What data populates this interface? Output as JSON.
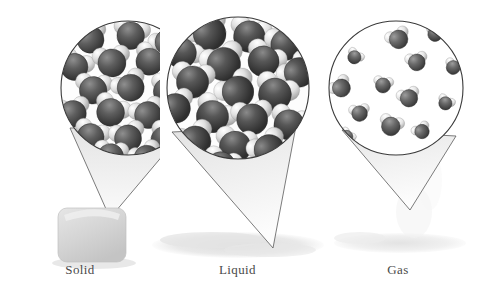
{
  "figure": {
    "background_color": "#ffffff",
    "width": 478,
    "height": 295
  },
  "palette": {
    "oxygen_dark": "#4b4b4b",
    "oxygen_mid": "#6e6e6e",
    "oxygen_light": "#9a9a9a",
    "hydrogen_light": "#f2f2f2",
    "hydrogen_mid": "#cfcfcf",
    "outline": "#3a3a3a",
    "cone_fill": "#ededed",
    "sample_fill": "#d8d8d8",
    "shadow": "#e2e2e2",
    "label_color": "#4a4a4a"
  },
  "panels": [
    {
      "key": "solid",
      "label": "Solid",
      "magnifier": {
        "cx": 128,
        "cy": 88,
        "r": 67
      },
      "cone": {
        "tip_x": 110,
        "tip_y": 218
      },
      "sample": {
        "type": "ice-cube",
        "x": 58,
        "y": 208,
        "width": 68,
        "height": 54
      },
      "packing": "ordered-lattice",
      "molecule_count": 20,
      "description": "Molecules locked in a fixed, ordered crystalline lattice"
    },
    {
      "key": "liquid",
      "label": "Liquid",
      "magnifier": {
        "cx": 238,
        "cy": 88,
        "r": 71
      },
      "cone": {
        "tip_x": 273,
        "tip_y": 248
      },
      "sample": {
        "type": "puddle",
        "x": 152,
        "y": 232,
        "width": 172,
        "height": 26
      },
      "packing": "close-packed-disordered",
      "molecule_count": 18,
      "description": "Molecules close together but free to slide past one another"
    },
    {
      "key": "gas",
      "label": "Gas",
      "magnifier": {
        "cx": 396,
        "cy": 88,
        "r": 67
      },
      "cone": {
        "tip_x": 410,
        "tip_y": 210
      },
      "sample": {
        "type": "vapor",
        "x": 330,
        "y": 230,
        "width": 140,
        "height": 24
      },
      "packing": "sparse-random",
      "molecule_count": 13,
      "description": "Molecules widely separated and moving independently"
    }
  ],
  "molecules": {
    "solid": [
      {
        "x": 0.22,
        "y": 0.12,
        "s": 1.0,
        "rot": -18
      },
      {
        "x": 0.52,
        "y": 0.09,
        "s": 1.02,
        "rot": 12
      },
      {
        "x": 0.8,
        "y": 0.14,
        "s": 0.98,
        "rot": -34
      },
      {
        "x": 0.1,
        "y": 0.33,
        "s": 1.0,
        "rot": 24
      },
      {
        "x": 0.38,
        "y": 0.3,
        "s": 1.04,
        "rot": -8
      },
      {
        "x": 0.66,
        "y": 0.29,
        "s": 1.0,
        "rot": 30
      },
      {
        "x": 0.92,
        "y": 0.35,
        "s": 0.96,
        "rot": -22
      },
      {
        "x": 0.24,
        "y": 0.51,
        "s": 1.02,
        "rot": 6
      },
      {
        "x": 0.52,
        "y": 0.49,
        "s": 1.0,
        "rot": -28
      },
      {
        "x": 0.79,
        "y": 0.52,
        "s": 1.0,
        "rot": 18
      },
      {
        "x": 0.09,
        "y": 0.69,
        "s": 0.98,
        "rot": -12
      },
      {
        "x": 0.37,
        "y": 0.68,
        "s": 1.03,
        "rot": 26
      },
      {
        "x": 0.65,
        "y": 0.7,
        "s": 1.0,
        "rot": -20
      },
      {
        "x": 0.91,
        "y": 0.72,
        "s": 0.96,
        "rot": 10
      },
      {
        "x": 0.22,
        "y": 0.87,
        "s": 1.0,
        "rot": 20
      },
      {
        "x": 0.5,
        "y": 0.88,
        "s": 1.0,
        "rot": -14
      },
      {
        "x": 0.77,
        "y": 0.89,
        "s": 0.98,
        "rot": 32
      },
      {
        "x": 0.37,
        "y": 1.02,
        "s": 0.96,
        "rot": 8
      },
      {
        "x": 0.64,
        "y": 1.03,
        "s": 0.94,
        "rot": -26
      },
      {
        "x": 0.09,
        "y": 1.0,
        "s": 0.94,
        "rot": 16
      }
    ],
    "liquid": [
      {
        "x": 0.3,
        "y": 0.1,
        "s": 1.06,
        "rot": -30
      },
      {
        "x": 0.58,
        "y": 0.12,
        "s": 1.02,
        "rot": 16
      },
      {
        "x": 0.84,
        "y": 0.18,
        "s": 1.0,
        "rot": -10
      },
      {
        "x": 0.1,
        "y": 0.24,
        "s": 0.98,
        "rot": 40
      },
      {
        "x": 0.4,
        "y": 0.32,
        "s": 1.08,
        "rot": -20
      },
      {
        "x": 0.68,
        "y": 0.3,
        "s": 1.0,
        "rot": 28
      },
      {
        "x": 0.93,
        "y": 0.38,
        "s": 0.96,
        "rot": -40
      },
      {
        "x": 0.18,
        "y": 0.45,
        "s": 1.04,
        "rot": 8
      },
      {
        "x": 0.5,
        "y": 0.52,
        "s": 1.02,
        "rot": -34
      },
      {
        "x": 0.76,
        "y": 0.54,
        "s": 1.06,
        "rot": 22
      },
      {
        "x": 0.06,
        "y": 0.64,
        "s": 0.96,
        "rot": -16
      },
      {
        "x": 0.32,
        "y": 0.7,
        "s": 1.04,
        "rot": 34
      },
      {
        "x": 0.6,
        "y": 0.72,
        "s": 1.0,
        "rot": -6
      },
      {
        "x": 0.86,
        "y": 0.76,
        "s": 0.98,
        "rot": 18
      },
      {
        "x": 0.2,
        "y": 0.88,
        "s": 1.0,
        "rot": -24
      },
      {
        "x": 0.48,
        "y": 0.92,
        "s": 1.02,
        "rot": 12
      },
      {
        "x": 0.72,
        "y": 0.94,
        "s": 0.98,
        "rot": -32
      },
      {
        "x": 0.38,
        "y": 1.06,
        "s": 0.94,
        "rot": 20
      }
    ],
    "gas": [
      {
        "x": 0.52,
        "y": 0.12,
        "s": 0.62,
        "rot": -25
      },
      {
        "x": 0.8,
        "y": 0.08,
        "s": 0.48,
        "rot": 15
      },
      {
        "x": 0.18,
        "y": 0.26,
        "s": 0.44,
        "rot": 35
      },
      {
        "x": 0.66,
        "y": 0.3,
        "s": 0.56,
        "rot": -12
      },
      {
        "x": 0.94,
        "y": 0.34,
        "s": 0.46,
        "rot": 22
      },
      {
        "x": 0.08,
        "y": 0.5,
        "s": 0.6,
        "rot": -38
      },
      {
        "x": 0.4,
        "y": 0.48,
        "s": 0.5,
        "rot": 10
      },
      {
        "x": 0.6,
        "y": 0.58,
        "s": 0.58,
        "rot": -18
      },
      {
        "x": 0.88,
        "y": 0.62,
        "s": 0.44,
        "rot": 28
      },
      {
        "x": 0.22,
        "y": 0.7,
        "s": 0.52,
        "rot": -8
      },
      {
        "x": 0.46,
        "y": 0.8,
        "s": 0.62,
        "rot": 18
      },
      {
        "x": 0.7,
        "y": 0.84,
        "s": 0.48,
        "rot": -30
      },
      {
        "x": 0.12,
        "y": 0.88,
        "s": 0.42,
        "rot": 40
      }
    ]
  }
}
